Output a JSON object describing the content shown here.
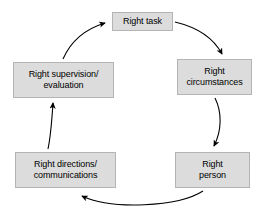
{
  "diagram": {
    "type": "cycle",
    "direction": "clockwise",
    "background_color": "#ffffff",
    "node_fill_color": "#dcdcdc",
    "node_border_color": "#b4b4b4",
    "text_color": "#000000",
    "arrow_color": "#000000",
    "nodes": [
      {
        "id": "task",
        "label": "Right task",
        "position": "top"
      },
      {
        "id": "circumstance",
        "label": "Right\ncircumstances",
        "position": "upper-right"
      },
      {
        "id": "person",
        "label": "Right\nperson",
        "position": "lower-right"
      },
      {
        "id": "directions",
        "label": "Right directions/\ncommunications",
        "position": "lower-left"
      },
      {
        "id": "supervision",
        "label": "Right supervision/\nevaluation",
        "position": "upper-left"
      }
    ],
    "edges": [
      {
        "id": "e1",
        "from": "task",
        "to": "circumstance"
      },
      {
        "id": "e2",
        "from": "circumstance",
        "to": "person"
      },
      {
        "id": "e3",
        "from": "person",
        "to": "directions"
      },
      {
        "id": "e4",
        "from": "directions",
        "to": "supervision"
      },
      {
        "id": "e5",
        "from": "supervision",
        "to": "task"
      }
    ]
  }
}
